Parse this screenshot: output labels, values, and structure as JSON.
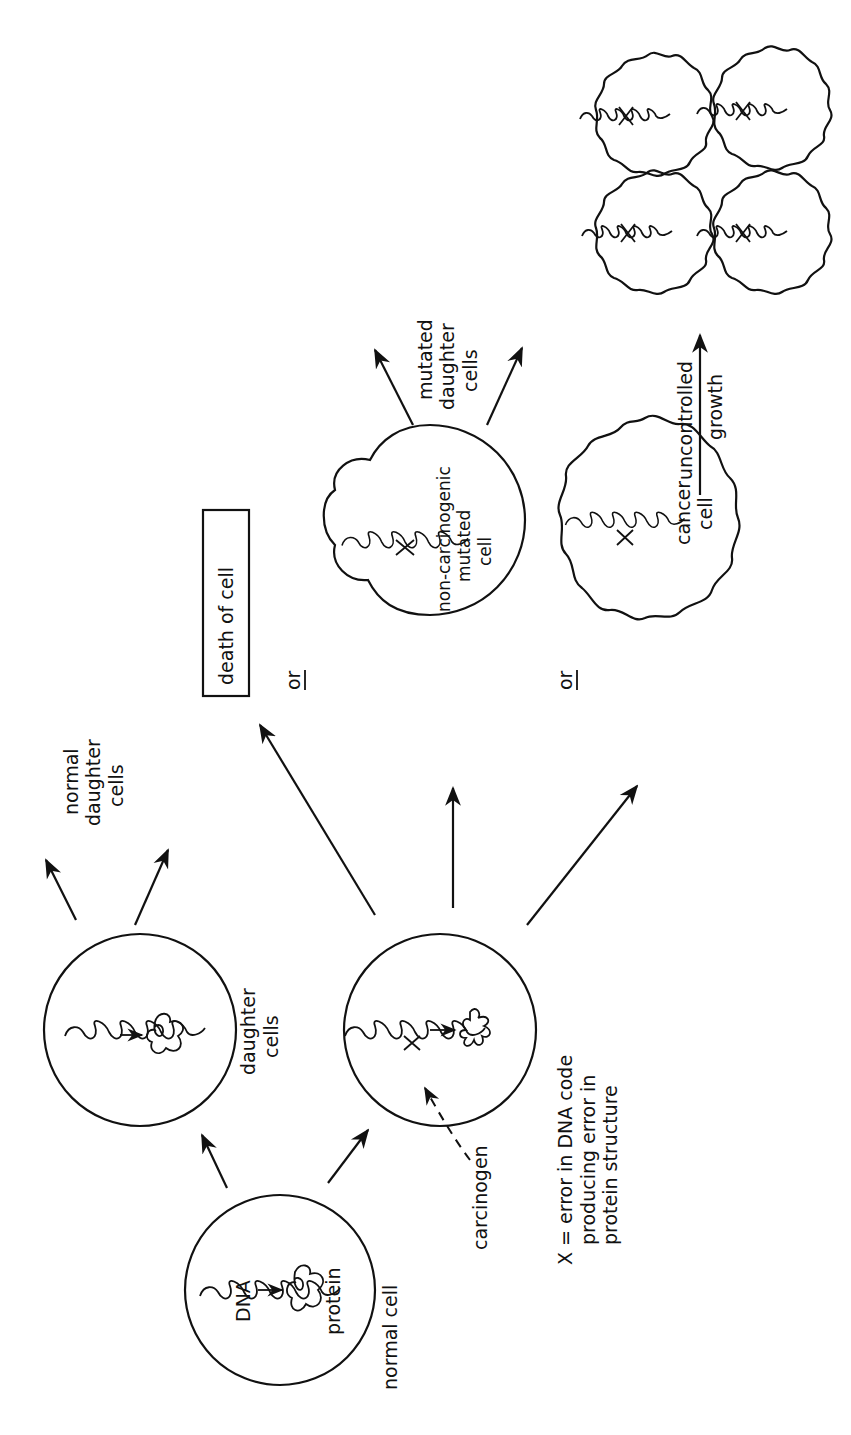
{
  "diagram": {
    "title": "",
    "orientation": "rotated-90-ccw",
    "cells": {
      "normal_cell": {
        "label": "normal cell",
        "dna_label": "DNA",
        "protein_label": "protein"
      },
      "daughter_cells": {
        "label_line1": "daughter",
        "label_line2": "cells"
      },
      "normal_daughter_cells": {
        "label_line1": "normal",
        "label_line2": "daughter",
        "label_line3": "cells"
      },
      "mutated_cell": {
        "carcinogen_label": "carcinogen"
      },
      "death": {
        "label": "death of cell"
      },
      "non_carcinogenic": {
        "label_line1": "non-carcinogenic",
        "label_line2": "mutated",
        "label_line3": "cell"
      },
      "mutated_daughter_cells": {
        "label_line1": "mutated",
        "label_line2": "daughter",
        "label_line3": "cells"
      },
      "cancer_cell": {
        "label_line1": "cancer",
        "label_line2": "cell"
      },
      "growth": {
        "label_line1": "uncontrolled",
        "label_line2": "growth"
      }
    },
    "or_labels": [
      "or",
      "or"
    ],
    "legend": {
      "line1": "X = error in DNA code",
      "line2": "producing error in",
      "line3": "protein structure"
    },
    "colors": {
      "ink": "#111111",
      "paper": "#ffffff"
    }
  }
}
